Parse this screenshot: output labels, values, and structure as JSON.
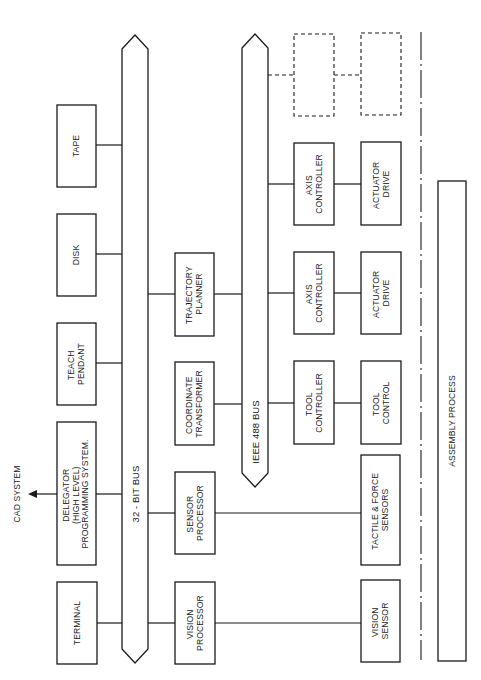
{
  "diagram": {
    "buses": {
      "main": {
        "label": "32 - BIT BUS"
      },
      "ieee": {
        "label": "IEEE 488 BUS"
      }
    },
    "external": {
      "cad_system": "CAD SYSTEM"
    },
    "left_column": {
      "tape": [
        "TAPE"
      ],
      "disk": [
        "DISK"
      ],
      "teach_pendant": [
        "TEACH",
        "PENDANT"
      ],
      "delegator": [
        "DELEGATOR",
        "(HIGH LEVEL)",
        "PROGRAMMING SYSTEM."
      ],
      "terminal": [
        "TERMINAL"
      ]
    },
    "middle_column": {
      "trajectory_planner": [
        "TRAJECTORY",
        "PLANNER"
      ],
      "coordinate_transformer": [
        "COORDINATE",
        "TRANSFORMER"
      ],
      "sensor_processor": [
        "SENSOR",
        "PROCESSOR"
      ],
      "vision_processor": [
        "VISION",
        "PROCESSOR"
      ]
    },
    "controllers": {
      "axis_controller_1": [
        "AXIS",
        "CONTROLLER"
      ],
      "axis_controller_2": [
        "AXIS",
        "CONTROLLER"
      ],
      "tool_controller": [
        "TOOL",
        "CONTROLLER"
      ]
    },
    "devices": {
      "actuator_drive_1": [
        "ACTUATOR",
        "DRIVE"
      ],
      "actuator_drive_2": [
        "ACTUATOR",
        "DRIVE"
      ],
      "tool_control": [
        "TOOL",
        "CONTROL"
      ],
      "tactile_force_sensors": [
        "TACTILE & FORCE",
        "SENSORS"
      ],
      "vision_sensor": [
        "VISION",
        "SENSOR"
      ]
    },
    "process": {
      "assembly_process": "ASSEMBLY PROCESS"
    },
    "colors": {
      "ink": "#1a1a1a",
      "background": "#ffffff"
    }
  }
}
